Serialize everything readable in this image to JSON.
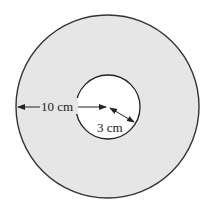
{
  "diagram": {
    "type": "annulus",
    "outer_circle": {
      "fill": "#e6e6e6",
      "stroke": "#333333"
    },
    "inner_circle": {
      "fill": "#ffffff",
      "stroke": "#222222"
    },
    "labels": {
      "outer_radius": "10 cm",
      "inner_radius": "3 cm"
    }
  }
}
